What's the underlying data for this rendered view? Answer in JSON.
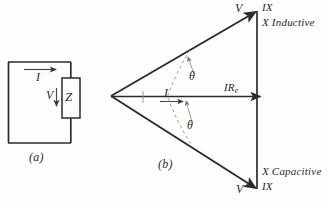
{
  "figure": {
    "caption_a": "(a)",
    "caption_b": "(b)"
  },
  "circuit": {
    "current_label": "I",
    "voltage_label": "V",
    "impedance_label": "Z"
  },
  "phasor": {
    "apex_vertex": "left",
    "resistive_axis_label": "IRe",
    "current_label": "I",
    "angle_label_upper": "θ",
    "angle_label_lower": "θ",
    "top": {
      "voltage_label": "V",
      "reactance_label": "IX",
      "reactance_type": "X Inductive"
    },
    "bottom": {
      "voltage_label": "V",
      "reactance_label": "IX",
      "reactance_type": "X Capacitive"
    }
  },
  "colors": {
    "ink": "#2b2b2b",
    "ink_light": "#4a4a4a",
    "ink_faint": "#8d8d8d",
    "paper": "#fefefe"
  }
}
